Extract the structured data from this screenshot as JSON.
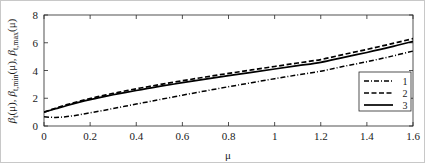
{
  "chart_data": {
    "type": "line",
    "title": "",
    "xlabel": "μ",
    "ylabel": "β_t(μ), β_t,min(μ), β_t,max(μ)",
    "ylabel_parts": {
      "p1_base": "β",
      "p1_sub": "t",
      "p1_arg": "(μ),",
      "p2_base": "β",
      "p2_sub": "t,min",
      "p2_arg": "(μ),",
      "p3_base": "β",
      "p3_sub": "t,max",
      "p3_arg": "(μ)"
    },
    "xlim": [
      0,
      1.6
    ],
    "ylim": [
      0,
      8
    ],
    "xticks": [
      0,
      0.2,
      0.4,
      0.6,
      0.8,
      1,
      1.2,
      1.4,
      1.6
    ],
    "xticklabels": [
      "0",
      "0.2",
      "0.4",
      "0.6",
      "0.8",
      "1",
      "1.2",
      "1.4",
      "1.6"
    ],
    "yticks": [
      0,
      2,
      4,
      6,
      8
    ],
    "yticklabels": [
      "0",
      "2",
      "4",
      "6",
      "8"
    ],
    "grid": false,
    "legend_position": "lower right",
    "x": [
      0,
      0.05,
      0.1,
      0.15,
      0.2,
      0.25,
      0.3,
      0.35,
      0.4,
      0.45,
      0.5,
      0.6,
      0.7,
      0.8,
      0.9,
      1.0,
      1.1,
      1.2,
      1.3,
      1.4,
      1.5,
      1.6
    ],
    "series": [
      {
        "name": "1",
        "label": "1",
        "style": "dash-dot",
        "color": "#000000",
        "values": [
          0.66,
          0.62,
          0.68,
          0.8,
          0.95,
          1.1,
          1.26,
          1.42,
          1.58,
          1.74,
          1.9,
          2.22,
          2.53,
          2.83,
          3.12,
          3.41,
          3.68,
          3.95,
          4.3,
          4.63,
          5.0,
          5.4
        ]
      },
      {
        "name": "2",
        "label": "2",
        "style": "dashed",
        "color": "#000000",
        "values": [
          1.0,
          1.28,
          1.54,
          1.77,
          1.98,
          2.17,
          2.35,
          2.52,
          2.68,
          2.83,
          2.98,
          3.26,
          3.53,
          3.79,
          4.04,
          4.29,
          4.54,
          4.79,
          5.16,
          5.52,
          5.9,
          6.3
        ]
      },
      {
        "name": "3",
        "label": "3",
        "style": "solid",
        "color": "#000000",
        "values": [
          1.0,
          1.24,
          1.48,
          1.7,
          1.9,
          2.08,
          2.25,
          2.41,
          2.56,
          2.71,
          2.85,
          3.12,
          3.38,
          3.63,
          3.87,
          4.11,
          4.35,
          4.59,
          4.95,
          5.3,
          5.68,
          6.1
        ]
      }
    ]
  },
  "legend": {
    "items": [
      {
        "label": "1",
        "style": "dash-dot"
      },
      {
        "label": "2",
        "style": "dashed"
      },
      {
        "label": "3",
        "style": "solid"
      }
    ]
  }
}
